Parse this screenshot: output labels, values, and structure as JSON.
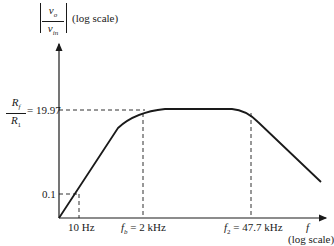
{
  "diagram": {
    "type": "bode-magnitude-plot",
    "y_axis": {
      "label_numerator": "v_o",
      "label_denominator": "v_in",
      "label_suffix": "(log scale)",
      "ticks": [
        {
          "label": "0.1",
          "value": 0.1
        },
        {
          "label_numerator": "R_f",
          "label_denominator": "R_1",
          "label_value": "= 19.97",
          "value": 19.97
        }
      ]
    },
    "x_axis": {
      "label": "f",
      "label_suffix": "(log scale)",
      "ticks": [
        {
          "label": "10 Hz",
          "value_hz": 10
        },
        {
          "label_sym": "f_b",
          "label_value": "= 2 kHz",
          "value_hz": 2000
        },
        {
          "label_sym": "f_2",
          "label_value": "= 47.7 kHz",
          "value_hz": 47700
        }
      ]
    },
    "curve": {
      "description": "band-pass magnitude response: rising slope from origin, flat passband at 19.97 between ~2 kHz and ~47.7 kHz, falling slope above"
    },
    "text": {
      "ylabel_num": "v",
      "ylabel_num_sub": "o",
      "ylabel_den": "v",
      "ylabel_den_sub": "in",
      "ylabel_suffix": "(log scale)",
      "rf_num": "R",
      "rf_num_sub": "f",
      "r1_den": "R",
      "r1_den_sub": "1",
      "gain_value": "= 19.97",
      "tick_01": "0.1",
      "tick_10hz": "10 Hz",
      "fb_sym": "f",
      "fb_sub": "b",
      "fb_value": "= 2 kHz",
      "f2_sym": "f",
      "f2_sub": "2",
      "f2_value": "= 47.7 kHz",
      "xlabel": "f",
      "xlabel_suffix": "(log scale)"
    }
  }
}
